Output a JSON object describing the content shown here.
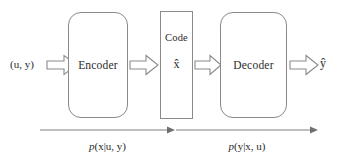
{
  "diagram": {
    "background_color": "#ffffff",
    "stroke_color": "#8a8a8a",
    "text_color": "#2b2b2b"
  },
  "io": {
    "input_label": "(u, y)",
    "output_label": "ŷ"
  },
  "nodes": {
    "encoder": {
      "label": "Encoder",
      "shape": "rounded-rect"
    },
    "code": {
      "title": "Code",
      "symbol": "x̂",
      "shape": "rect"
    },
    "decoder": {
      "label": "Decoder",
      "shape": "rounded-rect"
    }
  },
  "arrows": {
    "input_arrow": "block-arrow-right",
    "encoder_to_code": "block-arrow-right",
    "code_to_decoder": "block-arrow-right",
    "output_arrow": "block-arrow-right"
  },
  "flows": [
    {
      "name": "encode-flow",
      "p": "p",
      "expr": "(x|u, y)",
      "full": "p(x|u, y)"
    },
    {
      "name": "decode-flow",
      "p": "p",
      "expr": "(y|x, u)",
      "full": "p(y|x, u)"
    }
  ]
}
